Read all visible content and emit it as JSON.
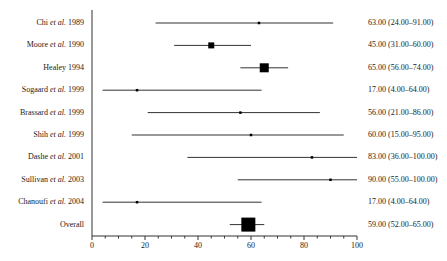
{
  "chart_data": {
    "type": "forest",
    "title": "",
    "xlabel": "",
    "ylabel": "",
    "xlim": [
      0,
      100
    ],
    "xticks": [
      0,
      20,
      40,
      60,
      80,
      100
    ],
    "grid": false,
    "studies": [
      {
        "label": "Chi",
        "etal": true,
        "year": "1989",
        "estimate": 63,
        "lower": 24,
        "upper": 91,
        "weight": 1,
        "text": "63.00 (24.00–91.00)"
      },
      {
        "label": "Moore",
        "etal": true,
        "year": "1990",
        "estimate": 45,
        "lower": 31,
        "upper": 60,
        "weight": 3,
        "text": "45.00 (31.00–60.00)"
      },
      {
        "label": "Healey",
        "etal": false,
        "year": "1994",
        "estimate": 65,
        "lower": 56,
        "upper": 74,
        "weight": 5,
        "text": "65.00 (56.00–74.00)"
      },
      {
        "label": "Sogaard",
        "etal": true,
        "year": "1999",
        "estimate": 17,
        "lower": 4,
        "upper": 64,
        "weight": 1,
        "text": "17.00 (4.00–64.00)"
      },
      {
        "label": "Brassard",
        "etal": true,
        "year": "1999",
        "estimate": 56,
        "lower": 21,
        "upper": 86,
        "weight": 1,
        "text": "56.00 (21.00–86.00)"
      },
      {
        "label": "Shih",
        "etal": true,
        "year": "1999",
        "estimate": 60,
        "lower": 15,
        "upper": 95,
        "weight": 1,
        "text": "60.00 (15.00–95.00)"
      },
      {
        "label": "Dashe",
        "etal": true,
        "year": "2001",
        "estimate": 83,
        "lower": 36,
        "upper": 100,
        "weight": 1,
        "text": "83.00 (36.00–100.00)"
      },
      {
        "label": "Sullivan",
        "etal": true,
        "year": "2003",
        "estimate": 90,
        "lower": 55,
        "upper": 100,
        "weight": 1,
        "text": "90.00 (55.00–100.00)"
      },
      {
        "label": "Chanoufi",
        "etal": true,
        "year": "2004",
        "estimate": 17,
        "lower": 4,
        "upper": 64,
        "weight": 1,
        "text": "17.00 (4.00–64.00)"
      }
    ],
    "overall": {
      "label": "Overall",
      "estimate": 59,
      "lower": 52,
      "upper": 65,
      "text": "59.00 (52.00–65.00)"
    }
  }
}
